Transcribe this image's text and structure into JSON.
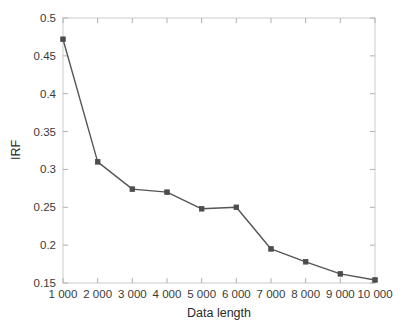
{
  "figure": {
    "background_color": "#ffffff",
    "axes_border_color": "#cccccc",
    "tick_color": "#b0b0b0",
    "text_color": "#3a3a3a"
  },
  "chart_data": {
    "type": "line",
    "title": "",
    "subtitle": "",
    "xlabel": "Data length",
    "ylabel": "IRF",
    "x": [
      1000,
      2000,
      3000,
      4000,
      5000,
      6000,
      7000,
      8000,
      9000,
      10000
    ],
    "values": [
      0.472,
      0.31,
      0.274,
      0.27,
      0.248,
      0.25,
      0.195,
      0.178,
      0.162,
      0.154
    ],
    "series": [
      {
        "name": "IRF",
        "values": [
          0.472,
          0.31,
          0.274,
          0.27,
          0.248,
          0.25,
          0.195,
          0.178,
          0.162,
          0.154
        ],
        "line_color": "#555555",
        "marker": "square",
        "marker_color": "#4d4d4d"
      }
    ],
    "xlim": [
      1000,
      10000
    ],
    "ylim": [
      0.15,
      0.5
    ],
    "xticks": [
      1000,
      2000,
      3000,
      4000,
      5000,
      6000,
      7000,
      8000,
      9000,
      10000
    ],
    "xticklabels": [
      "1 000",
      "2 000",
      "3 000",
      "4 000",
      "5 000",
      "6 000",
      "7 000",
      "8 000",
      "9 000",
      "10 000"
    ],
    "yticks": [
      0.15,
      0.2,
      0.25,
      0.3,
      0.35,
      0.4,
      0.45,
      0.5
    ],
    "yticklabels": [
      "0.15",
      "0.2",
      "0.25",
      "0.3",
      "0.35",
      "0.4",
      "0.45",
      "0.5"
    ],
    "grid": false,
    "legend": null,
    "legend_position": "none",
    "tick_direction": "in",
    "annotations": []
  }
}
